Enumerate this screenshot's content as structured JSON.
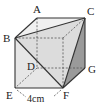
{
  "figure": {
    "type": "cube-with-cut-corner",
    "vertices": {
      "A": {
        "label": "A",
        "x": 37,
        "y": 18
      },
      "C": {
        "label": "C",
        "x": 85,
        "y": 18
      },
      "B": {
        "label": "B",
        "x": 15,
        "y": 38
      },
      "P": {
        "label": "",
        "x": 63,
        "y": 38
      },
      "D": {
        "label": "D",
        "x": 37,
        "y": 68
      },
      "G": {
        "label": "G",
        "x": 85,
        "y": 68
      },
      "E": {
        "label": "E",
        "x": 15,
        "y": 88
      },
      "F": {
        "label": "F",
        "x": 63,
        "y": 88
      }
    },
    "labels": {
      "A": "A",
      "B": "B",
      "C": "C",
      "D": "D",
      "E": "E",
      "F": "F",
      "G": "G",
      "dimension": "4cm"
    },
    "colors": {
      "edge": "#333333",
      "front_face": "#e6e6e6",
      "top_face": "#f0f0f0",
      "cut_face": "#dcdcdc",
      "side_face": "#9a9a9a",
      "hidden_edge": "#555555"
    }
  }
}
